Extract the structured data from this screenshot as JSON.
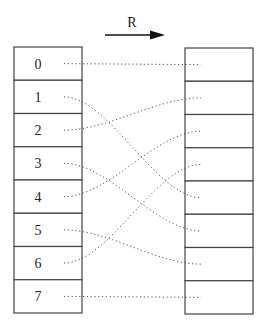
{
  "diagram": {
    "arrow_label": "R",
    "left_cells": [
      "0",
      "1",
      "2",
      "3",
      "4",
      "5",
      "6",
      "7"
    ],
    "right_cells": [
      "",
      "",
      "",
      "",
      "",
      "",
      "",
      ""
    ],
    "mapping": [
      {
        "from": 0,
        "to": 0
      },
      {
        "from": 1,
        "to": 4
      },
      {
        "from": 2,
        "to": 1
      },
      {
        "from": 3,
        "to": 5
      },
      {
        "from": 4,
        "to": 2
      },
      {
        "from": 5,
        "to": 6
      },
      {
        "from": 6,
        "to": 3
      },
      {
        "from": 7,
        "to": 7
      }
    ],
    "colors": {
      "stroke": "#444444",
      "dotted": "#555555",
      "arrow": "#111111"
    }
  }
}
